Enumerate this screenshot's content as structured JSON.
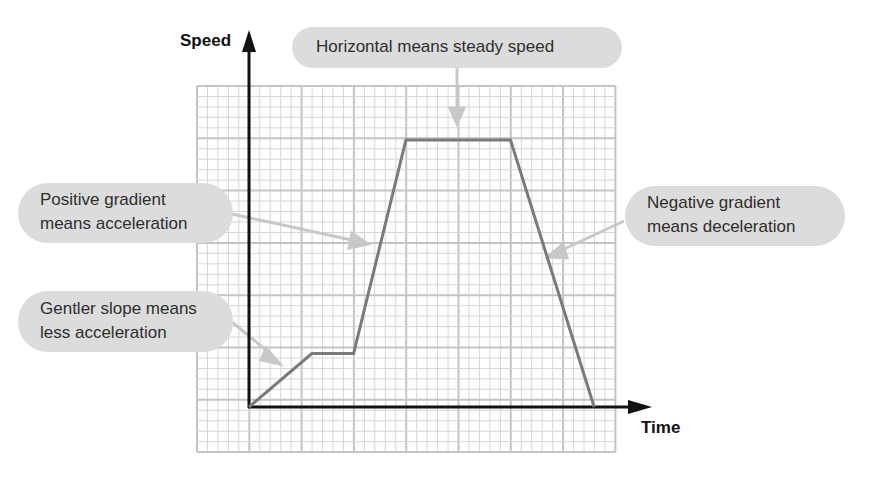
{
  "axes": {
    "y_label": "Speed",
    "x_label": "Time"
  },
  "annotations": {
    "top": {
      "lines": [
        "Horizontal means steady speed"
      ]
    },
    "positive": {
      "lines": [
        "Positive gradient",
        "means acceleration"
      ]
    },
    "gentler": {
      "lines": [
        "Gentler slope means",
        "less acceleration"
      ]
    },
    "negative": {
      "lines": [
        "Negative gradient",
        "means deceleration"
      ]
    }
  },
  "colors": {
    "grid_minor": "#d6d6d6",
    "grid_major": "#c4c4c4",
    "axis": "#111111",
    "graph_line": "#7a7a7a",
    "arrow": "#c8c8c8",
    "bubble": "#dcdcdc"
  },
  "chart_data": {
    "type": "line",
    "xlabel": "Time",
    "ylabel": "Speed",
    "grid": true,
    "x": [
      0,
      1.2,
      2.0,
      3.0,
      5.0,
      6.6
    ],
    "y": [
      0,
      1.0,
      1.0,
      5.0,
      5.0,
      0
    ],
    "segments": [
      {
        "from": [
          0,
          0
        ],
        "to": [
          1.2,
          1.0
        ],
        "note": "Gentler slope means less acceleration"
      },
      {
        "from": [
          1.2,
          1.0
        ],
        "to": [
          2.0,
          1.0
        ],
        "note": "steady speed"
      },
      {
        "from": [
          2.0,
          1.0
        ],
        "to": [
          3.0,
          5.0
        ],
        "note": "Positive gradient means acceleration"
      },
      {
        "from": [
          3.0,
          5.0
        ],
        "to": [
          5.0,
          5.0
        ],
        "note": "Horizontal means steady speed"
      },
      {
        "from": [
          5.0,
          5.0
        ],
        "to": [
          6.6,
          0
        ],
        "note": "Negative gradient means deceleration"
      }
    ]
  }
}
